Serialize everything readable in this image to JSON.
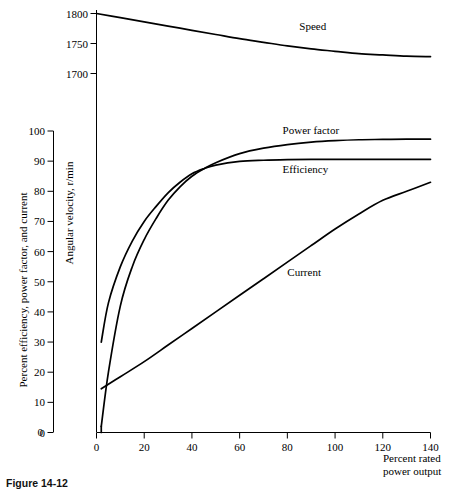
{
  "chart_data": {
    "type": "line",
    "title": "",
    "xlabel": "Percent rated power output",
    "ylabel_left": "Percent efficiency, power factor, and current",
    "ylabel_top": "Angular velocity, r/min",
    "xlim": [
      0,
      140
    ],
    "xticks": [
      0,
      20,
      40,
      60,
      80,
      100,
      120,
      140
    ],
    "xticklabels": [
      "0",
      "20",
      "40",
      "60",
      "80",
      "100",
      "120",
      "140"
    ],
    "ylim_left": [
      0,
      100
    ],
    "yticks_left": [
      0,
      10,
      20,
      30,
      40,
      50,
      60,
      70,
      80,
      90,
      100
    ],
    "yticklabels_left": [
      "0",
      "10",
      "20",
      "30",
      "40",
      "50",
      "60",
      "70",
      "80",
      "90",
      "100"
    ],
    "ylim_top": [
      1690,
      1805
    ],
    "yticks_top": [
      1700,
      1750,
      1800
    ],
    "yticklabels_top": [
      "1700",
      "1750",
      "1800"
    ],
    "grid": false,
    "legend_position": "inline-labels",
    "series": [
      {
        "name": "Speed",
        "axis": "top",
        "units": "r/min",
        "label_x": 85,
        "label_y": 1772,
        "x": [
          0,
          10,
          20,
          30,
          40,
          50,
          60,
          70,
          80,
          90,
          100,
          110,
          120,
          130,
          140
        ],
        "values": [
          1800,
          1793,
          1786,
          1779,
          1772,
          1765,
          1758,
          1752,
          1746,
          1741,
          1737,
          1733,
          1731,
          1729,
          1728
        ]
      },
      {
        "name": "Power factor",
        "axis": "left",
        "units": "percent",
        "label_x": 78,
        "label_y": 99,
        "x": [
          2,
          5,
          10,
          15,
          20,
          25,
          30,
          35,
          40,
          45,
          50,
          60,
          70,
          80,
          90,
          100,
          110,
          120,
          130,
          140
        ],
        "values": [
          2,
          20,
          42,
          55,
          64,
          71,
          77,
          81.5,
          85,
          87.5,
          89.5,
          92.5,
          94.3,
          95.5,
          96.3,
          96.8,
          97.1,
          97.2,
          97.3,
          97.3
        ]
      },
      {
        "name": "Efficiency",
        "axis": "left",
        "units": "percent",
        "label_x": 78,
        "label_y": 86,
        "x": [
          2,
          5,
          10,
          15,
          20,
          25,
          30,
          35,
          40,
          45,
          50,
          60,
          70,
          80,
          90,
          100,
          110,
          120,
          130,
          140
        ],
        "values": [
          30,
          43,
          55,
          63.5,
          70,
          75,
          79.5,
          83,
          85.8,
          87.5,
          88.7,
          89.9,
          90.3,
          90.5,
          90.6,
          90.6,
          90.6,
          90.6,
          90.6,
          90.6
        ]
      },
      {
        "name": "Current",
        "axis": "left",
        "units": "percent",
        "label_x": 80,
        "label_y": 52,
        "x": [
          2,
          10,
          20,
          30,
          40,
          50,
          60,
          70,
          80,
          90,
          100,
          110,
          120,
          130,
          140
        ],
        "values": [
          14.5,
          18.5,
          23.5,
          29,
          34.5,
          40,
          45.5,
          51,
          56.5,
          62,
          67.5,
          72.5,
          77,
          80,
          83
        ]
      }
    ],
    "zero_tick_left_standalone": "0"
  },
  "figure": {
    "caption_number": "Figure 14-12",
    "caption_text": ""
  }
}
